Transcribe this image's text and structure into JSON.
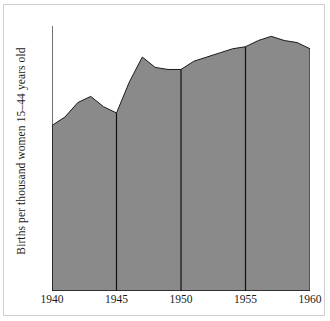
{
  "chart_data": {
    "type": "area",
    "title": "",
    "xlabel": "",
    "ylabel": "Births per thousand women 15–44 years old",
    "xlim": [
      1940,
      1960
    ],
    "ylim": [
      0,
      128
    ],
    "grid": false,
    "legend": "none",
    "fill_color": "#8a8a8a",
    "line_color": "#1a1a1a",
    "x": [
      1940,
      1941,
      1942,
      1943,
      1944,
      1945,
      1946,
      1947,
      1948,
      1949,
      1950,
      1951,
      1952,
      1953,
      1954,
      1955,
      1956,
      1957,
      1958,
      1959,
      1960
    ],
    "values": [
      80,
      84,
      91,
      94,
      89,
      86,
      101,
      113,
      108,
      107,
      107,
      111,
      113,
      115,
      117,
      118,
      121,
      123,
      121,
      120,
      117
    ],
    "x_ticks": [
      1940,
      1945,
      1950,
      1955,
      1960
    ],
    "x_tick_labels": [
      "1940",
      "1945",
      "1950",
      "1955",
      "1960"
    ],
    "y_ticks_major": [
      0,
      60,
      80,
      100,
      120
    ],
    "y_tick_labels": [
      "0",
      "60",
      "80",
      "100",
      "120"
    ],
    "y_ticks_minor": [
      70,
      90,
      110
    ],
    "vertical_marker_years": [
      1945,
      1950,
      1955
    ]
  }
}
